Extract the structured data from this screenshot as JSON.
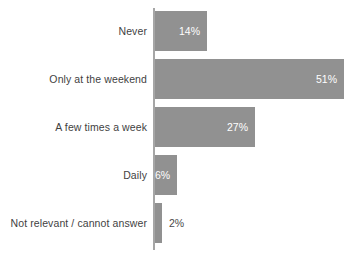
{
  "chart_data": {
    "type": "bar",
    "orientation": "horizontal",
    "title": "",
    "subtitle": "",
    "xlabel": "",
    "ylabel": "",
    "categories": [
      "Never",
      "Only at the weekend",
      "A few times a week",
      "Daily",
      "Not relevant / cannot answer"
    ],
    "values": [
      14,
      51,
      27,
      6,
      2
    ],
    "value_labels": [
      "14%",
      "51%",
      "27%",
      "6%",
      "2%"
    ],
    "label_placement": [
      "inside-end",
      "inside-end",
      "inside-end",
      "inside-end",
      "outside-end"
    ],
    "xlim": [
      0,
      51
    ],
    "grid": false,
    "legend": false,
    "axis_ticks": false,
    "bar_color": "#919191",
    "inside_label_color": "#ffffff",
    "outside_label_color": "#4a4a4a",
    "axis_line_color": "#a6a6a6",
    "category_label_color": "#3f3f3f",
    "background_color": "#ffffff"
  }
}
